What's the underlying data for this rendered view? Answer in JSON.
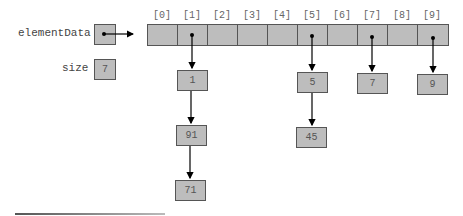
{
  "variables": {
    "elementData_label": "elementData",
    "size_label": "size",
    "size_value": "7"
  },
  "array": {
    "indices": [
      "[0]",
      "[1]",
      "[2]",
      "[3]",
      "[4]",
      "[5]",
      "[6]",
      "[7]",
      "[8]",
      "[9]"
    ]
  },
  "chains": [
    {
      "index": 1,
      "nodes": [
        "1",
        "91",
        "71"
      ]
    },
    {
      "index": 5,
      "nodes": [
        "5",
        "45"
      ]
    },
    {
      "index": 7,
      "nodes": [
        "7"
      ]
    },
    {
      "index": 9,
      "nodes": [
        "9"
      ]
    }
  ]
}
